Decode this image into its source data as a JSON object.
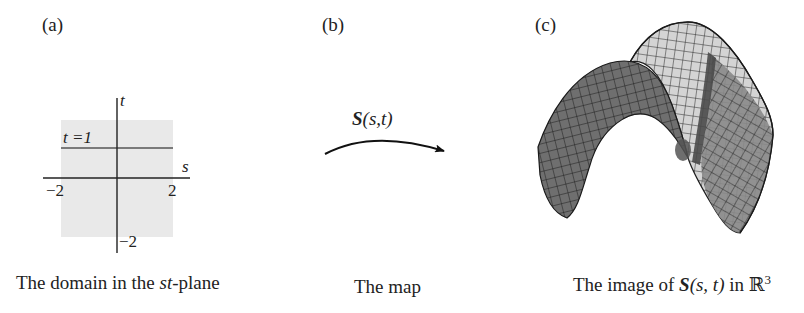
{
  "panels": [
    {
      "id": "a",
      "label": "(a)",
      "caption_prefix": "The domain in the ",
      "caption_italic": "st",
      "caption_suffix": "-plane",
      "axes": {
        "s_label": "s",
        "t_label": "t",
        "s_tick_left": "−2",
        "s_tick_right": "2",
        "t_tick_bottom": "−2",
        "line_label": "t =1"
      },
      "domain_fill": "#e8e8e8"
    },
    {
      "id": "b",
      "label": "(b)",
      "caption": "The map",
      "map_symbol": "S",
      "map_args": "(s,t)"
    },
    {
      "id": "c",
      "label": "(c)",
      "caption_prefix": "The image of ",
      "caption_symbol": "S",
      "caption_args": "(s, t)",
      "caption_mid": " in ",
      "caption_space": "ℝ",
      "caption_exp": "3",
      "surface_front_color": "#6e6e6e",
      "surface_back_color": "#d6d6d6",
      "grid_color": "#1e1e1e"
    }
  ]
}
